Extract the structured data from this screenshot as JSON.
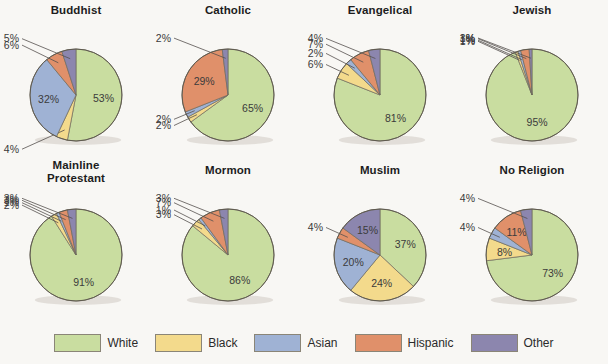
{
  "colors": {
    "White": "#c9dda0",
    "Black": "#f3da8c",
    "Asian": "#9fb2d4",
    "Hispanic": "#e0906a",
    "Other": "#8c86ae",
    "outline": "#6f6a5d",
    "background": "#f8f7f4",
    "label_text": "#3b3b3b",
    "title_text": "#1d1d1d"
  },
  "legend": {
    "items": [
      {
        "label": "White",
        "color": "#c9dda0"
      },
      {
        "label": "Black",
        "color": "#f3da8c"
      },
      {
        "label": "Asian",
        "color": "#9fb2d4"
      },
      {
        "label": "Hispanic",
        "color": "#e0906a"
      },
      {
        "label": "Other",
        "color": "#8c86ae"
      }
    ]
  },
  "chart_data": {
    "type": "pie",
    "title": "",
    "categories": [
      "White",
      "Black",
      "Asian",
      "Hispanic",
      "Other"
    ],
    "value_suffix": "%",
    "start_angle_deg": 0,
    "direction": "clockwise",
    "charts": [
      {
        "title": "Buddhist",
        "labels": [
          "53%",
          "4%",
          "32%",
          "6%",
          "5%"
        ],
        "values": [
          53,
          4,
          32,
          6,
          5
        ],
        "inside": [
          true,
          false,
          true,
          false,
          false
        ]
      },
      {
        "title": "Catholic",
        "labels": [
          "65%",
          "2%",
          "2%",
          "29%",
          "2%"
        ],
        "values": [
          65,
          2,
          2,
          29,
          2
        ],
        "inside": [
          true,
          false,
          false,
          true,
          false
        ]
      },
      {
        "title": "Evangelical",
        "labels": [
          "81%",
          "6%",
          "2%",
          "7%",
          "4%"
        ],
        "values": [
          81,
          6,
          2,
          7,
          4
        ],
        "inside": [
          true,
          false,
          false,
          false,
          false
        ]
      },
      {
        "title": "Jewish",
        "labels": [
          "95%",
          "1%",
          "1%",
          "3%",
          "1%"
        ],
        "values": [
          95,
          1,
          1,
          3,
          1
        ],
        "inside": [
          true,
          false,
          false,
          false,
          false
        ]
      },
      {
        "title": "Mainline\nProtestant",
        "labels": [
          "91%",
          "2%",
          "1%",
          "3%",
          "3%"
        ],
        "values": [
          91,
          2,
          1,
          3,
          3
        ],
        "inside": [
          true,
          false,
          false,
          false,
          false
        ]
      },
      {
        "title": "Mormon",
        "labels": [
          "86%",
          "3%",
          "1%",
          "7%",
          "3%"
        ],
        "values": [
          86,
          3,
          1,
          7,
          3
        ],
        "inside": [
          true,
          false,
          false,
          false,
          false
        ]
      },
      {
        "title": "Muslim",
        "labels": [
          "37%",
          "24%",
          "20%",
          "4%",
          "15%"
        ],
        "values": [
          37,
          24,
          20,
          4,
          15
        ],
        "inside": [
          true,
          true,
          true,
          false,
          true
        ]
      },
      {
        "title": "No Religion",
        "labels": [
          "73%",
          "8%",
          "4%",
          "11%",
          "4%"
        ],
        "values": [
          73,
          8,
          4,
          11,
          4
        ],
        "inside": [
          true,
          true,
          false,
          true,
          false
        ]
      }
    ]
  }
}
